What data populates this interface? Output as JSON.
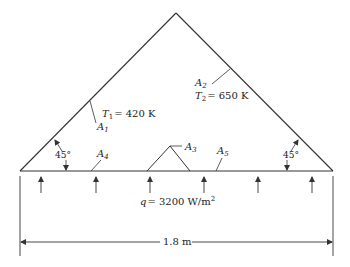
{
  "diagram": {
    "surfaces": {
      "A1": {
        "label": "A",
        "sub": "1",
        "temp_label": "T",
        "temp_sub": "1",
        "temp_value": "= 420 K"
      },
      "A2": {
        "label": "A",
        "sub": "2",
        "temp_label": "T",
        "temp_sub": "2",
        "temp_value": "= 650 K"
      },
      "A3": {
        "label": "A",
        "sub": "3"
      },
      "A4": {
        "label": "A",
        "sub": "4"
      },
      "A5": {
        "label": "A",
        "sub": "5"
      }
    },
    "angles": {
      "left": "45°",
      "right": "45°"
    },
    "heat_flux": {
      "symbol": "q",
      "value": "= 3200 W/m",
      "exponent": "2",
      "arrow_count": 6
    },
    "dimension": {
      "width": "1.8 m"
    },
    "colors": {
      "line": "#333333",
      "text": "#222222",
      "background": "#ffffff"
    }
  }
}
